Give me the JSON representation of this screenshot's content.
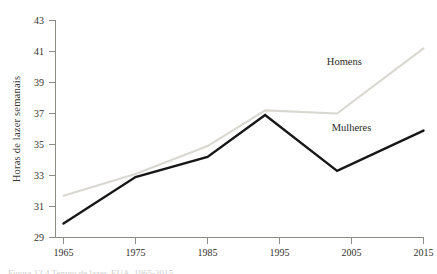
{
  "chart_data": {
    "type": "line",
    "title": "",
    "xlabel": "",
    "ylabel": "Horas de lazer semanais",
    "x": [
      1965,
      1975,
      1985,
      1993,
      2003,
      2015
    ],
    "xlim": [
      1963,
      2016
    ],
    "ylim": [
      29,
      43
    ],
    "xticks": [
      1965,
      1975,
      1985,
      1995,
      2005,
      2015
    ],
    "xtick_labels": [
      "1965",
      "1975",
      "1985",
      "1995",
      "2005",
      "2015"
    ],
    "yticks": [
      29,
      31,
      33,
      35,
      37,
      39,
      41,
      43
    ],
    "ytick_labels": [
      "29",
      "31",
      "33",
      "35",
      "37",
      "39",
      "41",
      "43"
    ],
    "grid": false,
    "legend_position": "inline-labels",
    "series": [
      {
        "name": "Homens",
        "color": "#d9d7d1",
        "values": [
          31.7,
          33.1,
          34.9,
          37.2,
          37.0,
          41.2
        ],
        "label_x": 2004,
        "label_y": 40.1
      },
      {
        "name": "Mulheres",
        "color": "#171717",
        "values": [
          29.9,
          32.9,
          34.2,
          36.9,
          33.3,
          35.9
        ],
        "label_x": 2005,
        "label_y": 35.9
      }
    ]
  },
  "axis": {
    "line_color": "#8d8b85",
    "tick_color": "#8d8b85",
    "text_color": "#33312e"
  },
  "caption": {
    "text": "Figura 12.4 Tempo de lazer, EUA, 1965-2015"
  }
}
